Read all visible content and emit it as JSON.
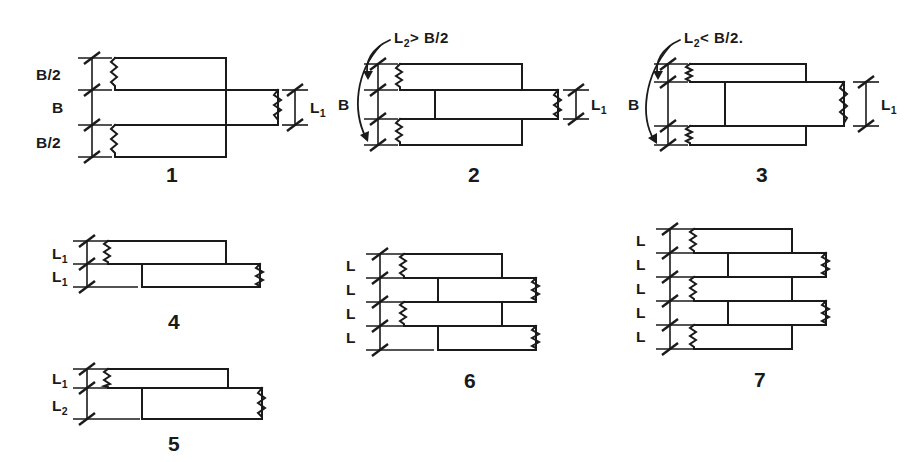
{
  "figure": {
    "background_color": "#ffffff",
    "line_color": "#1a1a1a"
  },
  "diagrams": [
    {
      "id": "diagram-1",
      "number": "1",
      "caption": "",
      "dim_labels": [
        {
          "text": "B/2",
          "base": "B/2",
          "sub": ""
        },
        {
          "text": "B",
          "base": "B",
          "sub": ""
        },
        {
          "text": "B/2",
          "base": "B/2",
          "sub": ""
        }
      ],
      "right_label": {
        "base": "L",
        "sub": "1"
      },
      "bars": 3
    },
    {
      "id": "diagram-2",
      "number": "2",
      "condition": {
        "lhs": "L",
        "lhs_sub": "2",
        "op": ">",
        "rhs": "B/2"
      },
      "condition_text": "L2 > B/2",
      "dim_labels": [
        {
          "text": "B",
          "base": "B",
          "sub": ""
        }
      ],
      "right_label": {
        "base": "L",
        "sub": "1"
      },
      "bars": 3
    },
    {
      "id": "diagram-3",
      "number": "3",
      "condition": {
        "lhs": "L",
        "lhs_sub": "2",
        "op": "<",
        "rhs": "B/2."
      },
      "condition_text": "L2 < B/2.",
      "dim_labels": [
        {
          "text": "B",
          "base": "B",
          "sub": ""
        }
      ],
      "right_label": {
        "base": "L",
        "sub": "1"
      },
      "bars": 3
    },
    {
      "id": "diagram-4",
      "number": "4",
      "dim_labels": [
        {
          "base": "L",
          "sub": "1"
        },
        {
          "base": "L",
          "sub": "1"
        }
      ],
      "bars": 2
    },
    {
      "id": "diagram-5",
      "number": "5",
      "dim_labels": [
        {
          "base": "L",
          "sub": "1"
        },
        {
          "base": "L",
          "sub": "2"
        }
      ],
      "bars": 2
    },
    {
      "id": "diagram-6",
      "number": "6",
      "dim_labels": [
        {
          "base": "L",
          "sub": ""
        },
        {
          "base": "L",
          "sub": ""
        },
        {
          "base": "L",
          "sub": ""
        },
        {
          "base": "L",
          "sub": ""
        }
      ],
      "bars": 4
    },
    {
      "id": "diagram-7",
      "number": "7",
      "dim_labels": [
        {
          "base": "L",
          "sub": ""
        },
        {
          "base": "L",
          "sub": ""
        },
        {
          "base": "L",
          "sub": ""
        },
        {
          "base": "L",
          "sub": ""
        },
        {
          "base": "L",
          "sub": ""
        }
      ],
      "bars": 5
    }
  ],
  "labels": {
    "d1_b2_top": "B/2",
    "d1_b": "B",
    "d1_b2_bot": "B/2",
    "d1_L": "L",
    "d1_L_sub": "1",
    "d1_num": "1",
    "d2_cond_L": "L",
    "d2_cond_L_sub": "2",
    "d2_cond_rest": "> B/2",
    "d2_b": "B",
    "d2_L": "L",
    "d2_L_sub": "1",
    "d2_num": "2",
    "d3_cond_L": "L",
    "d3_cond_L_sub": "2",
    "d3_cond_rest": "< B/2.",
    "d3_b": "B",
    "d3_L": "L",
    "d3_L_sub": "1",
    "d3_num": "3",
    "d4_L1": "L",
    "d4_L1_sub": "1",
    "d4_L2": "L",
    "d4_L2_sub": "1",
    "d4_num": "4",
    "d5_L1": "L",
    "d5_L1_sub": "1",
    "d5_L2": "L",
    "d5_L2_sub": "2",
    "d5_num": "5",
    "d6_L1": "L",
    "d6_L2": "L",
    "d6_L3": "L",
    "d6_L4": "L",
    "d6_num": "6",
    "d7_L1": "L",
    "d7_L2": "L",
    "d7_L3": "L",
    "d7_L4": "L",
    "d7_L5": "L",
    "d7_num": "7"
  }
}
